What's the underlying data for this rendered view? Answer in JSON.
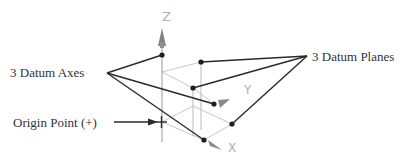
{
  "diagram": {
    "labels": {
      "datum_axes": "3 Datum Axes",
      "datum_planes": "3 Datum Planes",
      "origin_point": "Origin Point (+)"
    },
    "axis_labels": {
      "x": "X",
      "y": "Y",
      "z": "Z"
    },
    "colors": {
      "leader": "#2a2a2a",
      "plane_edge": "#c8c8c8",
      "axis_line": "#9a9a9a",
      "axis_cone": "#808080",
      "text": "#333333",
      "axis_text": "#b0b0b0"
    }
  }
}
